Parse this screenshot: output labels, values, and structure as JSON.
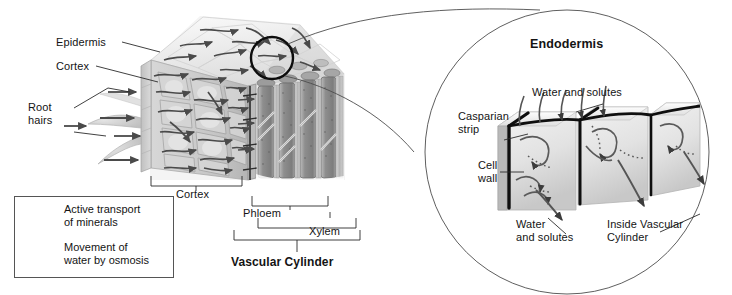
{
  "figure": {
    "type": "diagram",
    "main_panel": {
      "labels": {
        "epidermis": "Epidermis",
        "cortex_left": "Cortex",
        "root_hairs": "Root\nhairs",
        "cortex_bracket": "Cortex",
        "phloem": "Phloem",
        "xylem": "Xylem",
        "vascular_cylinder": "Vascular Cylinder"
      }
    },
    "inset_panel": {
      "title": "Endodermis",
      "labels": {
        "water_solutes_top": "Water and solutes",
        "casparian_strip": "Casparian\nstrip",
        "cell_wall": "Cell\nwall",
        "water_solutes_bottom": "Water\nand solutes",
        "inside_vascular_cylinder": "Inside Vascular\nCylinder"
      }
    },
    "legend": {
      "items": [
        {
          "icon": "arrow-right-icon",
          "label": "Active transport\nof minerals"
        },
        {
          "icon": "arrow-right-icon",
          "label": "Movement of\nwater by osmosis"
        }
      ]
    },
    "colors": {
      "ink": "#141414",
      "arrow": "#4a4a4a",
      "cell_light": "#e8e8e8",
      "cell_mid": "#c9c9c9",
      "cell_dark": "#9a9a9a",
      "vessel_dark": "#8a8a8a",
      "casparian": "#111111",
      "outline": "#555555",
      "background": "#ffffff"
    }
  }
}
